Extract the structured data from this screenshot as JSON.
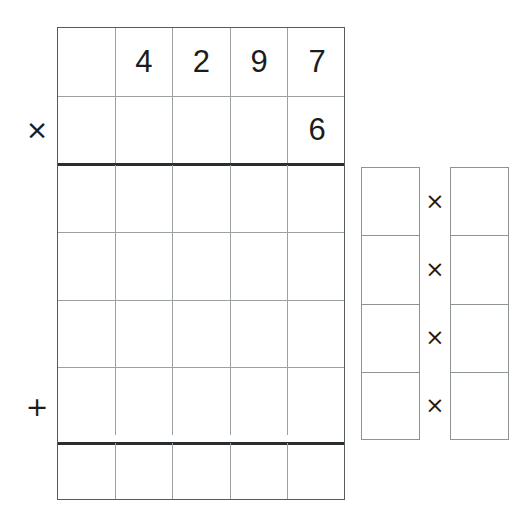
{
  "worksheet": {
    "type": "long-multiplication",
    "background_color": "#ffffff",
    "ink_color": "#1c1c1c",
    "grid_line_color": "#9ba0a3",
    "rule_color": "#2b2e30",
    "columns": 5,
    "rows": 7
  },
  "main_grid": {
    "rows": [
      {
        "name": "multiplicand-row",
        "cells": [
          "",
          "4",
          "2",
          "9",
          "7"
        ],
        "operator": ""
      },
      {
        "name": "multiplier-row",
        "cells": [
          "",
          "",
          "",
          "",
          "6"
        ],
        "operator": "×"
      },
      {
        "name": "partial-product-row-1",
        "cells": [
          "",
          "",
          "",
          "",
          ""
        ],
        "operator": ""
      },
      {
        "name": "partial-product-row-2",
        "cells": [
          "",
          "",
          "",
          "",
          ""
        ],
        "operator": ""
      },
      {
        "name": "partial-product-row-3",
        "cells": [
          "",
          "",
          "",
          "",
          ""
        ],
        "operator": ""
      },
      {
        "name": "partial-product-row-4",
        "cells": [
          "",
          "",
          "",
          "",
          ""
        ],
        "operator": "+"
      },
      {
        "name": "answer-row",
        "cells": [
          "",
          "",
          "",
          "",
          ""
        ],
        "operator": ""
      }
    ],
    "rules": [
      {
        "name": "multiply-rule",
        "after_row": 2
      },
      {
        "name": "sum-rule",
        "after_row": 6
      }
    ]
  },
  "helper": {
    "left_column": {
      "name": "digit-column",
      "cells": [
        "",
        "",
        "",
        ""
      ]
    },
    "right_column": {
      "name": "product-column",
      "cells": [
        "",
        "",
        "",
        ""
      ]
    },
    "operators": [
      "×",
      "×",
      "×",
      "×"
    ]
  }
}
